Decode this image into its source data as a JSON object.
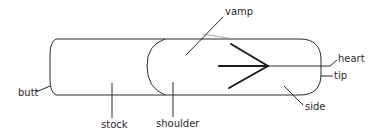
{
  "diagram": {
    "labels": {
      "butt": "butt",
      "stock": "stock",
      "shoulder": "shoulder",
      "vamp": "vamp",
      "heart": "heart",
      "tip": "tip",
      "side": "side"
    },
    "colors": {
      "line": "#2a2a2a",
      "background": "#ffffff"
    }
  }
}
